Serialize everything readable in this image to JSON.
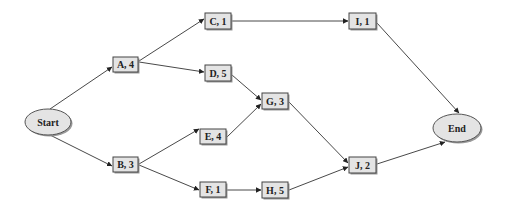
{
  "diagram": {
    "type": "activity-network",
    "nodes": [
      {
        "id": "start",
        "label": "Start",
        "shape": "ellipse",
        "cx": 48,
        "cy": 122,
        "rx": 23,
        "ry": 13
      },
      {
        "id": "A",
        "label": "A, 4",
        "shape": "box",
        "x": 113,
        "y": 57,
        "w": 25,
        "h": 15
      },
      {
        "id": "B",
        "label": "B, 3",
        "shape": "box",
        "x": 113,
        "y": 157,
        "w": 25,
        "h": 15
      },
      {
        "id": "C",
        "label": "C, 1",
        "shape": "box",
        "x": 205,
        "y": 13,
        "w": 26,
        "h": 16
      },
      {
        "id": "D",
        "label": "D, 5",
        "shape": "box",
        "x": 205,
        "y": 65,
        "w": 26,
        "h": 16
      },
      {
        "id": "E",
        "label": "E, 4",
        "shape": "box",
        "x": 200,
        "y": 129,
        "w": 26,
        "h": 15
      },
      {
        "id": "F",
        "label": "F, 1",
        "shape": "box",
        "x": 200,
        "y": 182,
        "w": 26,
        "h": 15
      },
      {
        "id": "G",
        "label": "G, 3",
        "shape": "box",
        "x": 262,
        "y": 93,
        "w": 26,
        "h": 16
      },
      {
        "id": "H",
        "label": "H, 5",
        "shape": "box",
        "x": 262,
        "y": 182,
        "w": 26,
        "h": 16
      },
      {
        "id": "I",
        "label": "I, 1",
        "shape": "box",
        "x": 349,
        "y": 13,
        "w": 27,
        "h": 16
      },
      {
        "id": "J",
        "label": "J, 2",
        "shape": "box",
        "x": 349,
        "y": 157,
        "w": 27,
        "h": 16
      },
      {
        "id": "end",
        "label": "End",
        "shape": "ellipse",
        "cx": 457,
        "cy": 128,
        "rx": 24,
        "ry": 14
      }
    ],
    "edges": [
      {
        "from": "start",
        "to": "A",
        "x1": 50,
        "y1": 109,
        "x2": 112,
        "y2": 67
      },
      {
        "from": "start",
        "to": "B",
        "x1": 50,
        "y1": 135,
        "x2": 112,
        "y2": 166
      },
      {
        "from": "A",
        "to": "C",
        "x1": 139,
        "y1": 61,
        "x2": 204,
        "y2": 19
      },
      {
        "from": "A",
        "to": "D",
        "x1": 139,
        "y1": 62,
        "x2": 204,
        "y2": 72
      },
      {
        "from": "B",
        "to": "E",
        "x1": 139,
        "y1": 164,
        "x2": 199,
        "y2": 129
      },
      {
        "from": "B",
        "to": "F",
        "x1": 139,
        "y1": 165,
        "x2": 199,
        "y2": 190
      },
      {
        "from": "C",
        "to": "I",
        "x1": 232,
        "y1": 21,
        "x2": 348,
        "y2": 21
      },
      {
        "from": "D",
        "to": "G",
        "x1": 232,
        "y1": 75,
        "x2": 261,
        "y2": 100
      },
      {
        "from": "E",
        "to": "G",
        "x1": 227,
        "y1": 137,
        "x2": 261,
        "y2": 104
      },
      {
        "from": "F",
        "to": "H",
        "x1": 227,
        "y1": 190,
        "x2": 261,
        "y2": 190
      },
      {
        "from": "G",
        "to": "J",
        "x1": 289,
        "y1": 102,
        "x2": 348,
        "y2": 163
      },
      {
        "from": "H",
        "to": "J",
        "x1": 289,
        "y1": 190,
        "x2": 348,
        "y2": 167
      },
      {
        "from": "I",
        "to": "end",
        "x1": 377,
        "y1": 23,
        "x2": 459,
        "y2": 113
      },
      {
        "from": "J",
        "to": "end",
        "x1": 377,
        "y1": 164,
        "x2": 445,
        "y2": 142
      }
    ]
  }
}
